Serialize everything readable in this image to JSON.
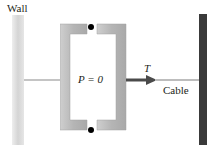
{
  "diagram": {
    "labels": {
      "wall": "Wall",
      "force": "P = 0",
      "tension": "T",
      "cable": "Cable"
    },
    "colors": {
      "wall_light": "#d8d8d8",
      "wall_dark": "#3a3a3a",
      "bracket": "#b9b9b9",
      "arrow": "#4a4a4a",
      "rope": "#bdbdbd",
      "pin": "#000000"
    }
  }
}
